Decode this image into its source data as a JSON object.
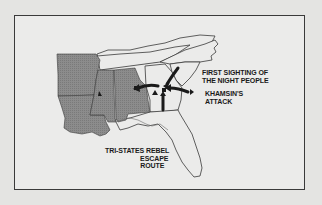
{
  "map": {
    "title": "",
    "colors": {
      "page_background": "#e4e4e2",
      "frame_background": "#ebebea",
      "frame_border": "#3a3a3a",
      "tri_states_fill": "#8a8a8a",
      "state_outline": "#3a3a3a",
      "arrow": "#1a1a1a",
      "label_text": "#1a1a1a"
    },
    "labels": {
      "first_sighting": [
        "FIRST SIGHTING OF",
        "THE NIGHT PEOPLE"
      ],
      "khamsin_attack": [
        "KHAMSIN'S",
        "ATTACK"
      ],
      "escape_route": [
        "TRI-STATES REBEL",
        "ESCAPE",
        "ROUTE"
      ]
    },
    "regions": [
      {
        "name": "Arkansas",
        "shaded": true
      },
      {
        "name": "Louisiana",
        "shaded": true
      },
      {
        "name": "Mississippi",
        "shaded": true
      },
      {
        "name": "Alabama",
        "shaded": true
      },
      {
        "name": "Tennessee",
        "shaded": false
      },
      {
        "name": "Kentucky/Virginia",
        "shaded": false
      },
      {
        "name": "North Carolina",
        "shaded": false
      },
      {
        "name": "South Carolina",
        "shaded": false
      },
      {
        "name": "Georgia",
        "shaded": false
      },
      {
        "name": "Florida",
        "shaded": false
      }
    ],
    "markers": [
      {
        "type": "triangle",
        "location": "Mississippi"
      },
      {
        "type": "square",
        "location": "Alabama/Georgia border"
      },
      {
        "type": "square",
        "location": "Georgia"
      },
      {
        "type": "triangle",
        "location": "Georgia"
      },
      {
        "type": "triangle",
        "location": "Georgia east"
      }
    ]
  }
}
